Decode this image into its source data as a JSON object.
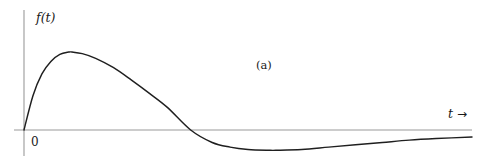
{
  "figure": {
    "panel_label": "(a)",
    "origin_label": "0",
    "y_axis_label": "f(t)",
    "x_axis_label": "t",
    "x_axis_arrow": "→",
    "colors": {
      "curve": "#1f1f1f",
      "axis": "#9a9a9a",
      "text": "#1a1a1a",
      "background": "#ffffff"
    }
  },
  "chart_data": {
    "type": "line",
    "title": "(a)",
    "xlabel": "t",
    "ylabel": "f(t)",
    "grid": false,
    "legend": null,
    "axis": {
      "x_axis_y_pixel": 130,
      "y_axis_x_pixel": 24,
      "x_range_pixels": [
        24,
        472
      ],
      "y_range_pixels": [
        10,
        156
      ]
    },
    "features": {
      "origin": {
        "x": 0,
        "y": 0
      },
      "peak": {
        "x": 0.107,
        "y": 1.0
      },
      "zero_crossing": {
        "x": 0.372,
        "y": 0
      },
      "trough": {
        "x": 0.562,
        "y": -0.26
      },
      "tail_end": {
        "x": 1.0,
        "y": -0.09
      }
    },
    "x": [
      0.0,
      0.02,
      0.04,
      0.06,
      0.08,
      0.1,
      0.107,
      0.13,
      0.16,
      0.2,
      0.24,
      0.28,
      0.32,
      0.372,
      0.42,
      0.46,
      0.5,
      0.55,
      0.562,
      0.62,
      0.68,
      0.74,
      0.8,
      0.86,
      0.92,
      1.0
    ],
    "y": [
      0.0,
      0.44,
      0.72,
      0.88,
      0.97,
      1.0,
      1.0,
      0.98,
      0.92,
      0.8,
      0.64,
      0.47,
      0.29,
      0.0,
      -0.16,
      -0.22,
      -0.25,
      -0.26,
      -0.26,
      -0.25,
      -0.22,
      -0.19,
      -0.16,
      -0.13,
      -0.11,
      -0.09
    ],
    "xlim": [
      0,
      1
    ],
    "ylim": [
      -0.42,
      1.12
    ]
  }
}
